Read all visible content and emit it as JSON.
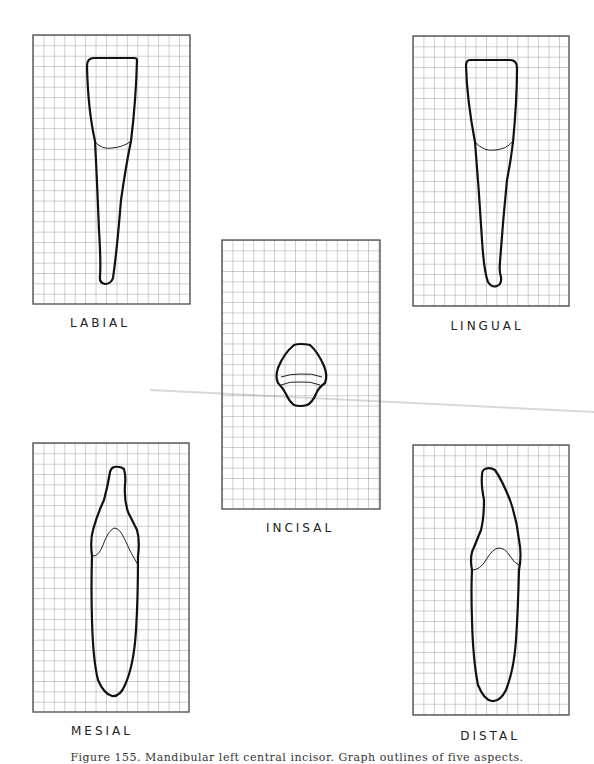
{
  "figure": {
    "caption": "Figure 155. Mandibular left central incisor. Graph outlines of five aspects.",
    "grid": {
      "columns": 15,
      "rows": 26,
      "line_color": "#8a8a8a",
      "border_color": "#555555",
      "outline_color": "#111111"
    },
    "panels": [
      {
        "id": "labial",
        "label": "LABIAL",
        "x": 33,
        "y": 35,
        "w": 157,
        "h": 269,
        "label_x": 100,
        "label_y": 316
      },
      {
        "id": "lingual",
        "label": "LINGUAL",
        "x": 413,
        "y": 36,
        "w": 156,
        "h": 270,
        "label_x": 487,
        "label_y": 319
      },
      {
        "id": "incisal",
        "label": "INCISAL",
        "x": 222,
        "y": 240,
        "w": 158,
        "h": 269,
        "label_x": 300,
        "label_y": 521
      },
      {
        "id": "mesial",
        "label": "MESIAL",
        "x": 33,
        "y": 443,
        "w": 156,
        "h": 269,
        "label_x": 102,
        "label_y": 724
      },
      {
        "id": "distal",
        "label": "DISTAL",
        "x": 413,
        "y": 445,
        "w": 156,
        "h": 270,
        "label_x": 490,
        "label_y": 729
      }
    ]
  }
}
